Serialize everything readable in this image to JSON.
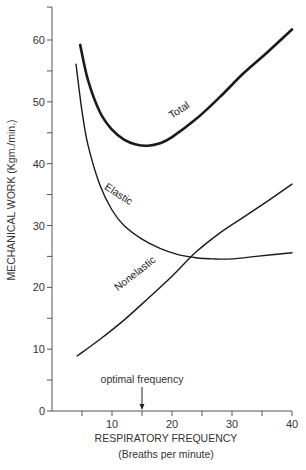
{
  "chart_data": {
    "type": "line",
    "title": "",
    "xlabel": "RESPIRATORY FREQUENCY",
    "xlabel_sub": "(Breaths per minute)",
    "ylabel": "MECHANICAL WORK (Kgm./min.)",
    "xlim": [
      0,
      40
    ],
    "ylim": [
      0,
      65
    ],
    "x_ticks": [
      5,
      10,
      15,
      20,
      25,
      30,
      35,
      40
    ],
    "x_tick_labels": [
      "10",
      "20",
      "30",
      "40"
    ],
    "x_tick_label_values": [
      10,
      20,
      30,
      40
    ],
    "y_ticks": [
      0,
      5,
      10,
      15,
      20,
      25,
      30,
      35,
      40,
      45,
      50,
      55,
      60
    ],
    "y_tick_labels": [
      "0",
      "10",
      "20",
      "30",
      "40",
      "50",
      "60"
    ],
    "y_tick_label_values": [
      0,
      10,
      20,
      30,
      40,
      50,
      60
    ],
    "grid": false,
    "legend": "none (inline curve labels)",
    "series": [
      {
        "name": "Total",
        "x": [
          4.7,
          6,
          8,
          10,
          12,
          14,
          16,
          18,
          20,
          24,
          28,
          32,
          36,
          40
        ],
        "values": [
          59.2,
          53.5,
          48.3,
          45.5,
          43.9,
          43.1,
          42.9,
          43.3,
          44.3,
          47.2,
          50.8,
          54.7,
          58.1,
          61.7
        ]
      },
      {
        "name": "Elastic",
        "x": [
          4.0,
          5,
          6,
          8,
          10,
          12,
          15,
          18,
          21,
          24,
          27,
          30,
          34,
          40
        ],
        "values": [
          56.1,
          48.5,
          43.0,
          36.5,
          32.5,
          30.0,
          27.8,
          26.3,
          25.3,
          24.8,
          24.6,
          24.6,
          25.0,
          25.6
        ]
      },
      {
        "name": "Nonelastic",
        "x": [
          4.2,
          8,
          12,
          16,
          20,
          24,
          28,
          32,
          36,
          40
        ],
        "values": [
          8.9,
          11.6,
          14.7,
          18.2,
          21.8,
          25.7,
          28.8,
          31.4,
          34.0,
          36.7
        ]
      }
    ],
    "annotations": [
      {
        "text": "optimal frequency",
        "x": 15,
        "type": "arrow-down-to-axis"
      }
    ]
  }
}
